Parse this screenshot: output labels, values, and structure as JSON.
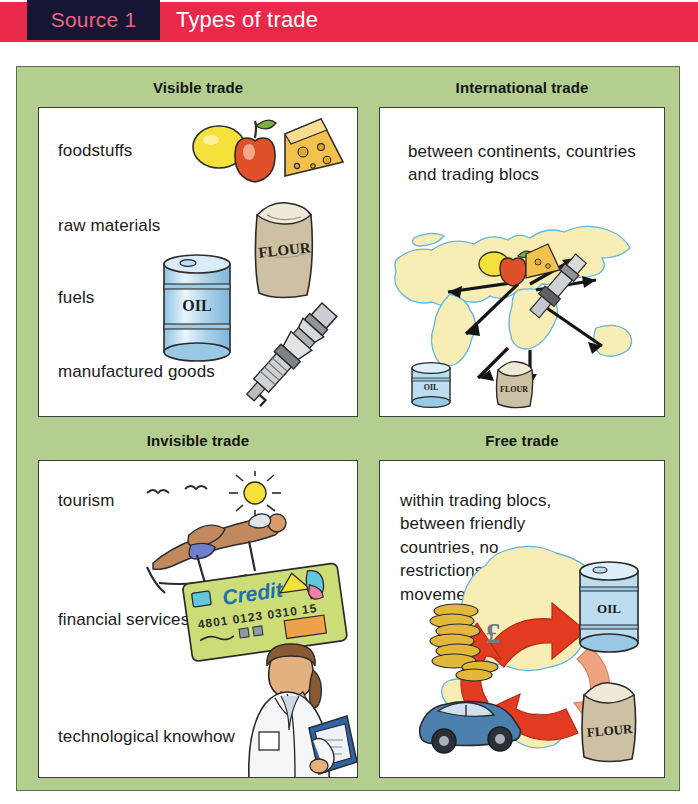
{
  "header": {
    "source_label": "Source 1",
    "title": "Types of trade",
    "tag_bg": "#151634",
    "tag_text_color": "#f2637f",
    "band_color": "#e8294a",
    "title_color": "#ffffff"
  },
  "frame": {
    "bg_color": "#b3ce8f",
    "border_color": "#5d6f49"
  },
  "panels": [
    {
      "id": "visible",
      "title": "Visible trade",
      "items": [
        "foodstuffs",
        "raw materials",
        "fuels",
        "manufactured goods"
      ],
      "illustrations": [
        "lemon-icon",
        "apple-icon",
        "cheese-wedge-icon",
        "flour-sack-icon",
        "oil-drum-icon",
        "spark-plug-icon"
      ],
      "label_texts_on_art": [
        "FLOUR",
        "OIL"
      ]
    },
    {
      "id": "international",
      "title": "International trade",
      "paragraph": "between continents, countries and trading blocs",
      "illustrations": [
        "world-map-icon",
        "lemon-icon",
        "apple-icon",
        "cheese-wedge-icon",
        "spark-plug-icon",
        "oil-drum-icon",
        "flour-sack-icon",
        "trade-arrows-icon"
      ],
      "label_texts_on_art": [
        "OIL",
        "FLOUR"
      ]
    },
    {
      "id": "invisible",
      "title": "Invisible trade",
      "items": [
        "tourism",
        "financial services",
        "technological knowhow"
      ],
      "illustrations": [
        "sun-icon",
        "seagull-icon",
        "sunbather-deckchair-icon",
        "credit-card-icon",
        "scientist-woman-icon"
      ],
      "credit_card": {
        "brand_text": "Credit",
        "number": "4801 0123 0310 15"
      }
    },
    {
      "id": "free",
      "title": "Free trade",
      "paragraph": "within trading blocs, between friendly countries, no restrictions on the movement of goods",
      "illustrations": [
        "europe-map-icon",
        "coin-stack-pound-icon",
        "oil-drum-icon",
        "flour-sack-icon",
        "car-icon",
        "circular-red-arrows-icon"
      ],
      "label_texts_on_art": [
        "OIL",
        "FLOUR",
        "£"
      ]
    }
  ],
  "colors": {
    "map_land": "#f8edb4",
    "map_sea_line": "#5fb6e0",
    "arrow_red": "#e23b22",
    "arrow_peach": "#f0a382",
    "oil_blue": "#bcdcef",
    "flour_tan": "#cdc0a3",
    "cheese_yellow": "#f2c14e",
    "apple_red": "#e0502a",
    "lemon_yellow": "#f4e03a",
    "card_green": "#ccdd78",
    "car_blue": "#4a7fae",
    "coin_gold": "#e2b83c"
  }
}
